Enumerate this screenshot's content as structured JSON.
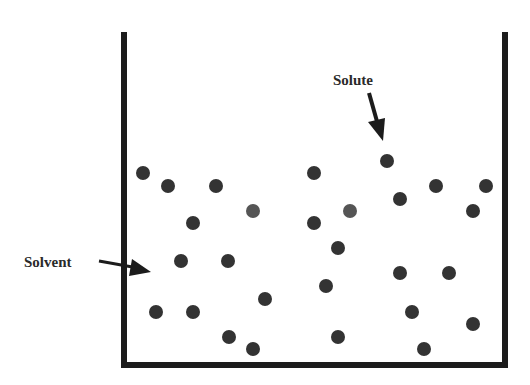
{
  "diagram": {
    "labels": {
      "solvent": "Solvent",
      "solute": "Solute"
    },
    "colors": {
      "wall": "#1c1c1c",
      "particle": "#333333",
      "particle_light": "#555555",
      "text": "#2a2a2a",
      "background": "#ffffff"
    },
    "container": {
      "left": 124,
      "top": 32,
      "right": 505,
      "bottom": 365,
      "wall_width": 6
    },
    "particle_radius": 7,
    "particles": [
      {
        "x": 143,
        "y": 173
      },
      {
        "x": 168,
        "y": 186
      },
      {
        "x": 216,
        "y": 186
      },
      {
        "x": 253,
        "y": 211
      },
      {
        "x": 193,
        "y": 223
      },
      {
        "x": 181,
        "y": 261
      },
      {
        "x": 228,
        "y": 261
      },
      {
        "x": 314,
        "y": 173
      },
      {
        "x": 387,
        "y": 161
      },
      {
        "x": 436,
        "y": 186
      },
      {
        "x": 486,
        "y": 186
      },
      {
        "x": 400,
        "y": 199
      },
      {
        "x": 350,
        "y": 211
      },
      {
        "x": 473,
        "y": 211
      },
      {
        "x": 314,
        "y": 223
      },
      {
        "x": 338,
        "y": 248
      },
      {
        "x": 265,
        "y": 299
      },
      {
        "x": 156,
        "y": 312
      },
      {
        "x": 193,
        "y": 312
      },
      {
        "x": 229,
        "y": 337
      },
      {
        "x": 253,
        "y": 349
      },
      {
        "x": 326,
        "y": 286
      },
      {
        "x": 400,
        "y": 273
      },
      {
        "x": 449,
        "y": 273
      },
      {
        "x": 412,
        "y": 312
      },
      {
        "x": 473,
        "y": 324
      },
      {
        "x": 338,
        "y": 337
      },
      {
        "x": 424,
        "y": 349
      }
    ]
  }
}
